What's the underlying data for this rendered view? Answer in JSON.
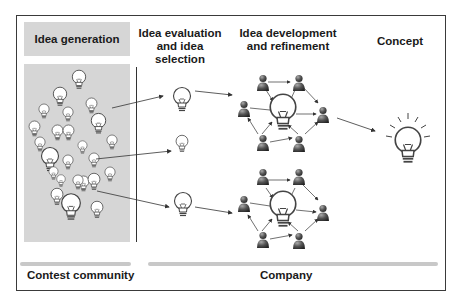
{
  "headers": {
    "idea_generation": "Idea generation",
    "evaluation_line1": "Idea evaluation",
    "evaluation_line2": "and idea selection",
    "development_line1": "Idea development",
    "development_line2": "and refinement",
    "concept": "Concept"
  },
  "footers": {
    "contest_community": "Contest community",
    "company": "Company"
  },
  "colors": {
    "panel_gray": "#d6d6d6",
    "bulb_fill": "#ffffff",
    "bulb_stroke": "#444444",
    "person_fill": "#555555",
    "arrow": "#333333"
  },
  "stages": [
    "Idea generation",
    "Idea evaluation and idea selection",
    "Idea development and refinement",
    "Concept"
  ]
}
